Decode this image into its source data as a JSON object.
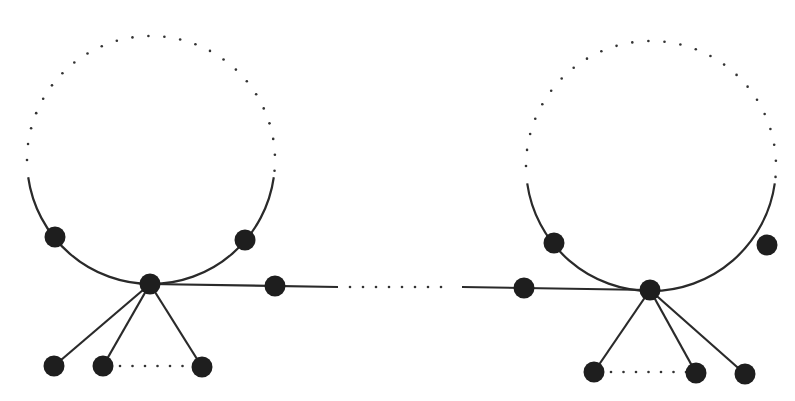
{
  "caption": "",
  "colors": {
    "stroke": "#2a2a2a",
    "node": "#1e1e1e",
    "dots": "#333333",
    "background": "#ffffff"
  },
  "graphs": [
    {
      "name": "left-graph",
      "cycle": {
        "cx": 151,
        "cy": 160,
        "r": 124,
        "solid_arc_start_deg": 172,
        "solid_arc_end_deg": 8
      },
      "hub": {
        "x": 150,
        "y": 284
      },
      "cycle_nodes": [
        {
          "x": 55,
          "y": 237
        },
        {
          "x": 245,
          "y": 240
        }
      ],
      "leaves": [
        {
          "x": 54,
          "y": 366
        },
        {
          "x": 103,
          "y": 366
        },
        {
          "x": 202,
          "y": 367
        }
      ],
      "leaf_dots": {
        "x1": 120,
        "x2": 192,
        "y": 366
      },
      "path_node": {
        "x": 275,
        "y": 286
      }
    },
    {
      "name": "right-graph",
      "cycle": {
        "cx": 651,
        "cy": 166,
        "r": 125,
        "solid_arc_start_deg": 172,
        "solid_arc_end_deg": 8
      },
      "hub": {
        "x": 650,
        "y": 290
      },
      "cycle_nodes": [
        {
          "x": 554,
          "y": 243
        },
        {
          "x": 767,
          "y": 245
        }
      ],
      "leaves": [
        {
          "x": 594,
          "y": 372
        },
        {
          "x": 696,
          "y": 373
        },
        {
          "x": 745,
          "y": 374
        }
      ],
      "leaf_dots": {
        "x1": 611,
        "x2": 686,
        "y": 372
      },
      "path_node": {
        "x": 524,
        "y": 288
      }
    }
  ],
  "connector": {
    "left_solid_end_x": 338,
    "right_solid_start_x": 462,
    "y": 287
  }
}
